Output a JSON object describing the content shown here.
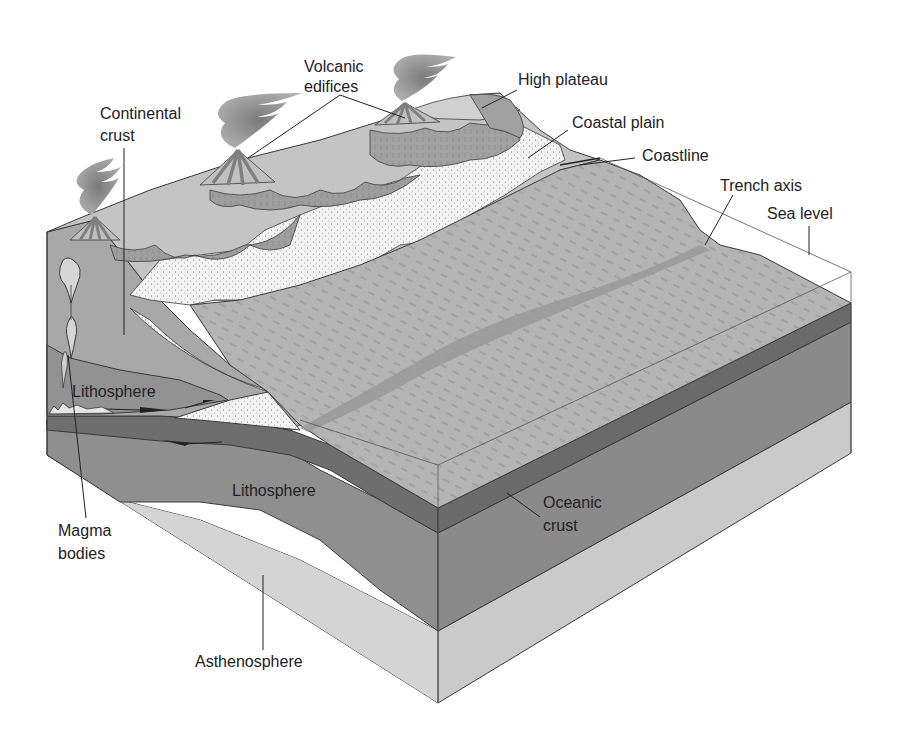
{
  "figure": {
    "colors": {
      "background": "#ffffff",
      "outline": "#3a3a3a",
      "ocean_floor": "#b4b4b4",
      "oceanic_crust": "#6e6e6e",
      "lithosphere": "#8f8f8f",
      "asthenosphere": "#d2d2d2",
      "continental_crust": "#a8a8a8",
      "plateau": "#c8c8c8",
      "coastal_plain": "#f2f2f2",
      "trench": "#9a9a9a",
      "ash": "#8a8a8a",
      "label_text": "#222222"
    }
  },
  "labels": {
    "volcanic_edifices": [
      "Volcanic",
      "edifices"
    ],
    "continental_crust": [
      "Continental",
      "crust"
    ],
    "high_plateau": "High plateau",
    "coastal_plain": "Coastal plain",
    "coastline": "Coastline",
    "trench_axis": "Trench axis",
    "sea_level": "Sea level",
    "lithosphere_upper": "Lithosphere",
    "lithosphere_lower": "Lithosphere",
    "magma_bodies": [
      "Magma",
      "bodies"
    ],
    "oceanic_crust": [
      "Oceanic",
      "crust"
    ],
    "asthenosphere": "Asthenosphere"
  }
}
